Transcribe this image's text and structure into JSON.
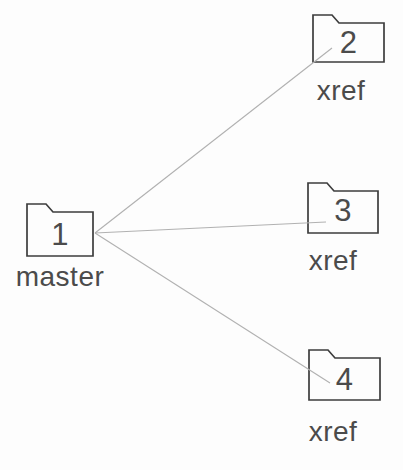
{
  "diagram": {
    "type": "folder-reference-diagram",
    "colors": {
      "outline": "#3d3d3d",
      "connector": "#b1b1b1",
      "text": "#4b4b4b",
      "background": "#fdfdfd",
      "folder_fill": "#fdfdfd"
    },
    "nodes": [
      {
        "id": "master",
        "number": "1",
        "label": "master"
      },
      {
        "id": "xref-2",
        "number": "2",
        "label": "xref"
      },
      {
        "id": "xref-3",
        "number": "3",
        "label": "xref"
      },
      {
        "id": "xref-4",
        "number": "4",
        "label": "xref"
      }
    ],
    "edges": [
      {
        "from": "master",
        "to": "xref-2"
      },
      {
        "from": "master",
        "to": "xref-3"
      },
      {
        "from": "master",
        "to": "xref-4"
      }
    ]
  }
}
